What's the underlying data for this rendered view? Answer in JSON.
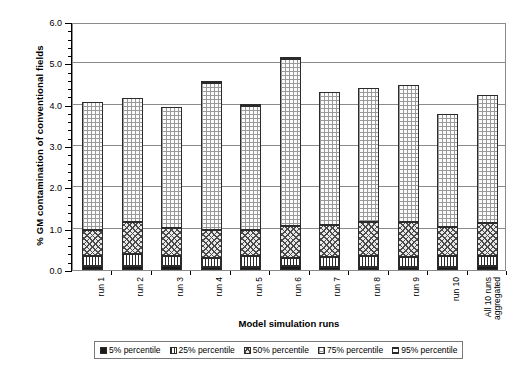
{
  "chart_data": {
    "type": "bar",
    "stacked": true,
    "title": "",
    "xlabel": "Model simulation runs",
    "ylabel": "% GM contamination of conventional fields",
    "ylim": [
      0.0,
      6.0
    ],
    "ytick_labels": [
      "0.0",
      "1.0",
      "2.0",
      "3.0",
      "4.0",
      "5.0",
      "6.0"
    ],
    "ytick_values": [
      0.0,
      1.0,
      2.0,
      3.0,
      4.0,
      5.0,
      6.0
    ],
    "yminor_step": 0.2,
    "grid": "horizontal",
    "legend_position": "bottom",
    "categories": [
      "run 1",
      "run 2",
      "run 3",
      "run 4",
      "run 5",
      "run 6",
      "run 7",
      "run 8",
      "run 9",
      "run 10",
      "All 10 runs aggregated"
    ],
    "series": [
      {
        "name": "5% percentile",
        "pattern": "solid-black",
        "values": [
          0.1,
          0.09,
          0.09,
          0.08,
          0.08,
          0.09,
          0.08,
          0.08,
          0.08,
          0.08,
          0.09
        ]
      },
      {
        "name": "25% percentile",
        "pattern": "vertical-lines",
        "values": [
          0.25,
          0.29,
          0.26,
          0.22,
          0.26,
          0.19,
          0.24,
          0.25,
          0.24,
          0.25,
          0.25
        ]
      },
      {
        "name": "50% percentile",
        "pattern": "cross-hatch",
        "values": [
          0.62,
          0.78,
          0.66,
          0.68,
          0.63,
          0.78,
          0.76,
          0.84,
          0.83,
          0.71,
          0.79
        ]
      },
      {
        "name": "75% percentile",
        "pattern": "dotted",
        "values": [
          3.09,
          3.01,
          2.93,
          3.55,
          3.01,
          4.05,
          3.22,
          3.23,
          3.33,
          2.74,
          3.11
        ]
      },
      {
        "name": "95% percentile",
        "pattern": "horizontal-lines",
        "values": [
          0.0,
          0.0,
          0.0,
          0.0,
          0.0,
          0.0,
          0.0,
          0.0,
          0.0,
          0.0,
          0.0
        ]
      }
    ],
    "totals": [
      4.06,
      4.17,
      3.94,
      4.53,
      3.98,
      5.11,
      4.3,
      4.4,
      4.48,
      3.78,
      4.24
    ]
  },
  "legend": {
    "items": [
      {
        "label": "5% percentile",
        "pattern": "solid-black"
      },
      {
        "label": "25% percentile",
        "pattern": "vertical-lines"
      },
      {
        "label": "50% percentile",
        "pattern": "cross-hatch"
      },
      {
        "label": "75% percentile",
        "pattern": "dotted"
      },
      {
        "label": "95% percentile",
        "pattern": "horizontal-lines"
      }
    ]
  },
  "axes": {
    "y_title": "% GM contamination of conventional fields",
    "x_title": "Model simulation runs"
  },
  "colors": {
    "frame": "#8a8a8a",
    "ink": "#1a1a1a",
    "background": "#ffffff"
  }
}
